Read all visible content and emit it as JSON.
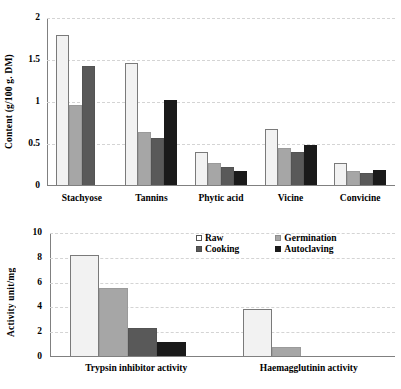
{
  "figure": {
    "series_names": [
      "Raw",
      "Germination",
      "Cooking",
      "Autoclaving"
    ],
    "series_colors": [
      "#f2f2f2",
      "#a6a6a6",
      "#595959",
      "#1a1a1a"
    ]
  },
  "legend": {
    "position": "top-center-of-lower-panel",
    "items": [
      {
        "label": "Raw",
        "swatch": "white-square-icon"
      },
      {
        "label": "Germination",
        "swatch": "light-gray-square-icon"
      },
      {
        "label": "Cooking",
        "swatch": "dark-gray-square-icon"
      },
      {
        "label": "Autoclaving",
        "swatch": "black-square-icon"
      }
    ]
  },
  "chart_data": [
    {
      "id": "content-chart",
      "type": "bar",
      "title": "",
      "xlabel": "",
      "ylabel": "Content (g/100 g. DM)",
      "ylim": [
        0,
        2
      ],
      "yticks": [
        "0",
        "0.5",
        "1",
        "1.5",
        "2"
      ],
      "ytick_values": [
        0,
        0.5,
        1,
        1.5,
        2
      ],
      "grid": true,
      "legend": "none",
      "categories": [
        "Stachyose",
        "Tannins",
        "Phytic acid",
        "Vicine",
        "Convicine"
      ],
      "series": [
        {
          "name": "Raw",
          "values": [
            1.8,
            1.46,
            0.4,
            0.68,
            0.27
          ]
        },
        {
          "name": "Germination",
          "values": [
            0.96,
            0.64,
            0.27,
            0.45,
            0.18
          ]
        },
        {
          "name": "Cooking",
          "values": [
            1.43,
            0.57,
            0.23,
            0.41,
            0.155
          ]
        },
        {
          "name": "Autoclaving",
          "values": [
            0.0,
            1.02,
            0.18,
            0.49,
            0.19
          ]
        }
      ]
    },
    {
      "id": "activity-chart",
      "type": "bar",
      "title": "",
      "xlabel": "",
      "ylabel": "Activity unit/mg",
      "ylim": [
        0,
        10
      ],
      "yticks": [
        "0",
        "2",
        "4",
        "6",
        "8",
        "10"
      ],
      "ytick_values": [
        0,
        2,
        4,
        6,
        8,
        10
      ],
      "grid": true,
      "legend": "top-center",
      "categories": [
        "Trypsin inhibitor activity",
        "Haemagglutinin activity"
      ],
      "series": [
        {
          "name": "Raw",
          "values": [
            8.2,
            3.85
          ]
        },
        {
          "name": "Germination",
          "values": [
            5.6,
            0.8
          ]
        },
        {
          "name": "Cooking",
          "values": [
            2.3,
            0.0
          ]
        },
        {
          "name": "Autoclaving",
          "values": [
            1.25,
            0.0
          ]
        }
      ]
    }
  ]
}
